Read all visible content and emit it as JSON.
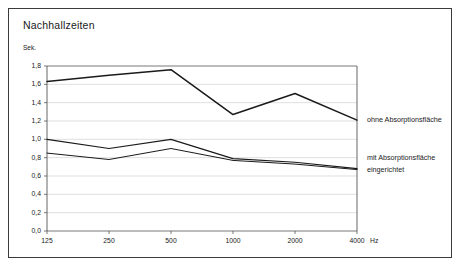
{
  "chart_data": {
    "type": "line",
    "title": "Nachhallzeiten",
    "xlabel": "Hz",
    "ylabel": "Sek.",
    "categories": [
      "125",
      "250",
      "500",
      "1000",
      "2000",
      "4000"
    ],
    "xtick_labels": [
      "125",
      "250",
      "500",
      "1000",
      "2000",
      "4000"
    ],
    "x_unit": "Hz",
    "ytick_labels": [
      "0,0",
      "0,2",
      "0,4",
      "0,6",
      "0,8",
      "1,0",
      "1,2",
      "1,4",
      "1,6",
      "1,8"
    ],
    "ylim": [
      0.0,
      1.8
    ],
    "ystep": 0.2,
    "grid": true,
    "legend_position": "right",
    "series": [
      {
        "name": "ohne Absorptionsfläche",
        "values": [
          1.63,
          1.7,
          1.76,
          1.27,
          1.5,
          1.21
        ],
        "color": "#1a1a1a",
        "width": 1.5
      },
      {
        "name": "mit Absorptionsfläche eingerichtet",
        "values": [
          1.0,
          0.9,
          1.0,
          0.79,
          0.75,
          0.68
        ],
        "color": "#1a1a1a",
        "width": 1.2
      },
      {
        "name": "mit Absorptionsfläche eingerichtet (2)",
        "values": [
          0.85,
          0.78,
          0.9,
          0.77,
          0.73,
          0.67
        ],
        "color": "#1a1a1a",
        "width": 1.0
      }
    ],
    "annotations": [
      {
        "text": "ohne Absorptionsfläche",
        "x": 4000,
        "y": 1.21
      },
      {
        "text": "mit Absorptionsfläche",
        "x": 4000,
        "y": 0.8
      },
      {
        "text": "eingerichtet",
        "x": 4000,
        "y": 0.7
      }
    ]
  },
  "legend": {
    "line1": "ohne Absorptionsfläche",
    "line2": "mit Absorptionsfläche",
    "line3": "eingerichtet"
  },
  "colors": {
    "frame": "#3a3a3a",
    "axis": "#555555",
    "grid": "#c8c8d2",
    "series": "#1a1a1a",
    "background": "#ffffff"
  }
}
